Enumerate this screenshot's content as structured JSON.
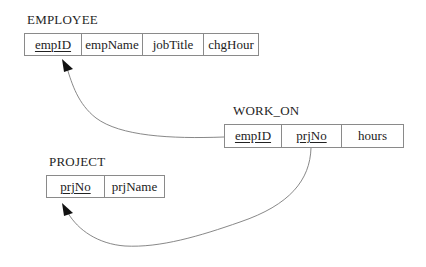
{
  "diagram": {
    "type": "relational-schema",
    "relations": [
      {
        "name": "EMPLOYEE",
        "attributes": [
          {
            "name": "empID",
            "primary_key": true
          },
          {
            "name": "empName",
            "primary_key": false
          },
          {
            "name": "jobTitle",
            "primary_key": false
          },
          {
            "name": "chgHour",
            "primary_key": false
          }
        ]
      },
      {
        "name": "WORK_ON",
        "attributes": [
          {
            "name": "empID",
            "primary_key": true
          },
          {
            "name": "prjNo",
            "primary_key": true
          },
          {
            "name": "hours",
            "primary_key": false
          }
        ]
      },
      {
        "name": "PROJECT",
        "attributes": [
          {
            "name": "prjNo",
            "primary_key": true
          },
          {
            "name": "prjName",
            "primary_key": false
          }
        ]
      }
    ],
    "foreign_keys": [
      {
        "from": "WORK_ON.empID",
        "to": "EMPLOYEE.empID"
      },
      {
        "from": "WORK_ON.prjNo",
        "to": "PROJECT.prjNo"
      }
    ],
    "colors": {
      "border": "#8a8a8a",
      "line": "#7a7a7a",
      "arrowhead": "#111111",
      "text": "#222222",
      "background": "#ffffff"
    }
  }
}
